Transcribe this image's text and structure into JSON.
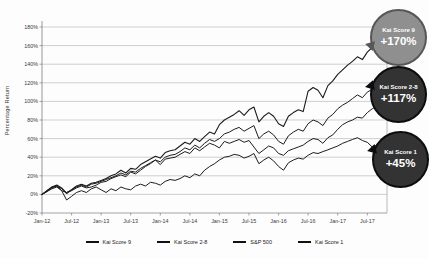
{
  "chart_data": {
    "type": "line",
    "title": "",
    "ylabel": "Percentage Return",
    "xlabel": "",
    "ylim": [
      -20,
      180
    ],
    "yticks": [
      -20,
      0,
      20,
      40,
      60,
      80,
      100,
      120,
      140,
      160,
      180
    ],
    "ytick_suffix": "%",
    "grid": true,
    "legend_position": "bottom",
    "x_unit": "month",
    "xticks": [
      {
        "index": 0,
        "label": "Jan-12"
      },
      {
        "index": 6,
        "label": "Jul-12"
      },
      {
        "index": 12,
        "label": "Jan-13"
      },
      {
        "index": 18,
        "label": "Jul-13"
      },
      {
        "index": 24,
        "label": "Jan-14"
      },
      {
        "index": 30,
        "label": "Jul-14"
      },
      {
        "index": 36,
        "label": "Jan-15"
      },
      {
        "index": 42,
        "label": "Jul-15"
      },
      {
        "index": 48,
        "label": "Jan-16"
      },
      {
        "index": 54,
        "label": "Jul-16"
      },
      {
        "index": 60,
        "label": "Jan-17"
      },
      {
        "index": 66,
        "label": "Jul-17"
      }
    ],
    "series": [
      {
        "name": "Kai Score 9",
        "color": "#1c1c1c",
        "width": 1.1,
        "values": [
          0,
          4,
          8,
          10,
          7,
          1,
          5,
          9,
          11,
          9,
          12,
          13,
          15,
          17,
          20,
          22,
          26,
          23,
          28,
          27,
          32,
          35,
          38,
          41,
          39,
          45,
          47,
          48,
          52,
          56,
          54,
          60,
          57,
          62,
          67,
          65,
          75,
          80,
          83,
          86,
          90,
          85,
          91,
          94,
          78,
          84,
          88,
          84,
          76,
          73,
          84,
          88,
          91,
          89,
          111,
          115,
          112,
          104,
          117,
          122,
          129,
          134,
          139,
          143,
          148,
          145,
          153,
          158,
          161,
          166,
          170
        ]
      },
      {
        "name": "Kai Score 2-8",
        "color": "#1c1c1c",
        "width": 1.0,
        "values": [
          0,
          3,
          7,
          9,
          6,
          2,
          5,
          8,
          10,
          8,
          11,
          12,
          14,
          16,
          18,
          20,
          23,
          21,
          25,
          24,
          28,
          31,
          34,
          37,
          35,
          40,
          42,
          43,
          46,
          50,
          48,
          53,
          50,
          55,
          59,
          57,
          60,
          65,
          67,
          70,
          72,
          68,
          71,
          74,
          60,
          65,
          68,
          64,
          57,
          54,
          63,
          67,
          70,
          68,
          76,
          80,
          78,
          74,
          82,
          86,
          92,
          96,
          99,
          103,
          107,
          104,
          110,
          113,
          111,
          115,
          117
        ]
      },
      {
        "name": "S&P 500",
        "color": "#1c1c1c",
        "width": 1.0,
        "values": [
          0,
          4,
          8,
          9,
          4,
          2,
          4,
          7,
          9,
          7,
          8,
          10,
          13,
          14,
          17,
          19,
          21,
          19,
          24,
          22,
          26,
          30,
          33,
          37,
          32,
          38,
          39,
          40,
          43,
          46,
          44,
          50,
          47,
          51,
          55,
          53,
          50,
          57,
          55,
          57,
          59,
          56,
          58,
          51,
          44,
          48,
          52,
          50,
          44,
          42,
          47,
          49,
          51,
          53,
          57,
          60,
          59,
          55,
          61,
          64,
          70,
          75,
          78,
          80,
          83,
          82,
          88,
          92,
          95,
          102,
          107
        ]
      },
      {
        "name": "Kai Score 1",
        "color": "#1c1c1c",
        "width": 1.0,
        "values": [
          0,
          3,
          6,
          8,
          4,
          -6,
          -2,
          2,
          4,
          2,
          6,
          8,
          5,
          2,
          6,
          4,
          8,
          6,
          5,
          9,
          11,
          9,
          13,
          12,
          10,
          14,
          16,
          15,
          17,
          20,
          18,
          22,
          20,
          26,
          30,
          33,
          37,
          40,
          41,
          43,
          42,
          39,
          41,
          44,
          33,
          37,
          40,
          36,
          30,
          26,
          34,
          37,
          39,
          38,
          42,
          45,
          44,
          46,
          48,
          50,
          52,
          55,
          57,
          59,
          61,
          58,
          56,
          51,
          53,
          49,
          45
        ]
      }
    ],
    "annotations": [
      {
        "label": "Kai Score 9",
        "value": "+170%",
        "fill": "#8f8f8f",
        "border": "#575757"
      },
      {
        "label": "Kai Score 2-8",
        "value": "+117%",
        "fill": "#333333",
        "border": "#0d0d0d"
      },
      {
        "label": "Kai Score 1",
        "value": "+45%",
        "fill": "#333333",
        "border": "#0d0d0d"
      }
    ]
  }
}
